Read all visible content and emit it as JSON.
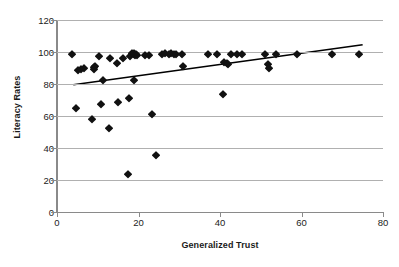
{
  "chart_data": {
    "type": "scatter",
    "title": "",
    "xlabel": "Generalized Trust",
    "ylabel": "Literacy Rates",
    "xlim": [
      0,
      80
    ],
    "ylim": [
      0,
      120
    ],
    "xticks": [
      0,
      20,
      40,
      60,
      80
    ],
    "yticks": [
      0,
      20,
      40,
      60,
      80,
      100,
      120
    ],
    "grid": "horizontal",
    "legend": "none",
    "marker": "diamond",
    "marker_color": "#111111",
    "gridline_color": "#b0b0b0",
    "axis_color": "#8a8a8a",
    "points": [
      [
        3.8,
        98.5
      ],
      [
        4.6,
        65.0
      ],
      [
        5.2,
        89.0
      ],
      [
        6.0,
        89.5
      ],
      [
        6.6,
        90.0
      ],
      [
        8.6,
        58.0
      ],
      [
        9.0,
        90.5
      ],
      [
        9.2,
        89.5
      ],
      [
        9.4,
        91.0
      ],
      [
        10.4,
        97.5
      ],
      [
        10.8,
        67.8
      ],
      [
        11.2,
        82.3
      ],
      [
        12.8,
        52.3
      ],
      [
        13.0,
        96.3
      ],
      [
        14.8,
        93.0
      ],
      [
        15.0,
        69.0
      ],
      [
        16.2,
        96.5
      ],
      [
        17.4,
        24.0
      ],
      [
        17.6,
        71.4
      ],
      [
        18.0,
        97.8
      ],
      [
        18.4,
        99.5
      ],
      [
        18.8,
        98.8
      ],
      [
        19.0,
        99.6
      ],
      [
        19.2,
        98.0
      ],
      [
        19.4,
        99.0
      ],
      [
        19.6,
        98.4
      ],
      [
        19.0,
        82.5
      ],
      [
        21.6,
        98.0
      ],
      [
        22.6,
        98.3
      ],
      [
        23.2,
        61.0
      ],
      [
        24.2,
        35.8
      ],
      [
        25.8,
        99.0
      ],
      [
        26.4,
        99.3
      ],
      [
        27.6,
        98.6
      ],
      [
        28.0,
        99.2
      ],
      [
        28.6,
        98.8
      ],
      [
        29.2,
        99.0
      ],
      [
        30.6,
        98.8
      ],
      [
        31.0,
        91.0
      ],
      [
        37.0,
        99.0
      ],
      [
        39.2,
        99.0
      ],
      [
        40.8,
        74.0
      ],
      [
        41.0,
        93.6
      ],
      [
        41.6,
        93.0
      ],
      [
        42.0,
        92.4
      ],
      [
        42.6,
        99.0
      ],
      [
        44.2,
        98.8
      ],
      [
        45.4,
        99.0
      ],
      [
        51.0,
        99.0
      ],
      [
        51.8,
        92.5
      ],
      [
        52.0,
        90.2
      ],
      [
        53.8,
        98.7
      ],
      [
        58.8,
        99.0
      ],
      [
        67.6,
        99.0
      ],
      [
        74.0,
        99.0
      ]
    ],
    "trendline": {
      "x0": 4.0,
      "y0": 79.5,
      "x1": 75.0,
      "y1": 104.5,
      "color": "#000000",
      "width": 1.6
    }
  }
}
